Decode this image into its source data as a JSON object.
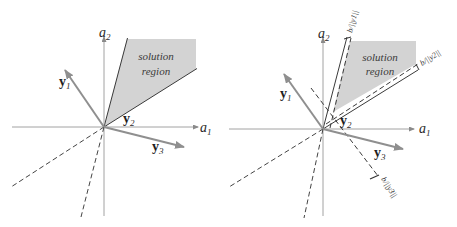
{
  "colors": {
    "axis": "#8a8a8a",
    "region_fill": "#d3d3d3",
    "boundary": "#3a3a3a",
    "vector": "#8f8f8f",
    "dashed": "#3a3a3a",
    "text": "#2a2a2a"
  },
  "left_panel": {
    "axis_x_label": "a",
    "axis_x_sub": "1",
    "axis_y_label": "a",
    "axis_y_sub": "2",
    "region_line1": "solution",
    "region_line2": "region",
    "vectors": [
      {
        "name": "y",
        "sub": "1"
      },
      {
        "name": "y",
        "sub": "2"
      },
      {
        "name": "y",
        "sub": "3"
      }
    ]
  },
  "right_panel": {
    "axis_x_label": "a",
    "axis_x_sub": "1",
    "axis_y_label": "a",
    "axis_y_sub": "2",
    "region_line1": "solution",
    "region_line2": "region",
    "vectors": [
      {
        "name": "y",
        "sub": "1"
      },
      {
        "name": "y",
        "sub": "2"
      },
      {
        "name": "y",
        "sub": "3"
      }
    ],
    "margins": [
      {
        "label": "b/||y1||"
      },
      {
        "label": "b/||y2||"
      },
      {
        "label": "b/||y3||"
      }
    ]
  }
}
